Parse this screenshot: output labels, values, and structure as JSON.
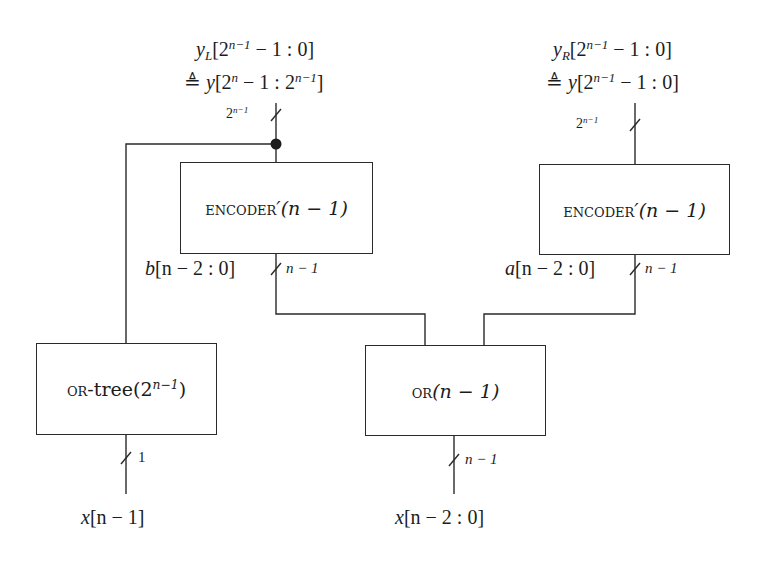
{
  "diagram": {
    "type": "block-diagram",
    "title": "",
    "blocks": [
      {
        "id": "encoder_left",
        "name_sc": "encoder",
        "suffix": "′(n − 1)",
        "label": "ENCODER′(n − 1)"
      },
      {
        "id": "encoder_right",
        "name_sc": "encoder",
        "suffix": "′(n − 1)",
        "label": "ENCODER′(n − 1)"
      },
      {
        "id": "or_tree",
        "name_sc": "or",
        "suffix": "-tree(2",
        "exp": "n−1",
        "close": ")",
        "label": "OR-tree(2^{n−1})"
      },
      {
        "id": "or_n1",
        "name_sc": "or",
        "suffix": "(n − 1)",
        "label": "OR(n − 1)"
      }
    ],
    "top_left_output": {
      "line1": {
        "var": "y",
        "sub": "L",
        "open": "[2",
        "exp": "n−1",
        "rest": " − 1 : 0]"
      },
      "line2": {
        "prefix": "≜ ",
        "var": "y",
        "open": "[2",
        "exp1": "n",
        "mid": " − 1 : 2",
        "exp2": "n−1",
        "close": "]"
      },
      "text": "y_L[2^{n−1} − 1 : 0] ≜ y[2^n − 1 : 2^{n−1}]"
    },
    "top_right_output": {
      "line1": {
        "var": "y",
        "sub": "R",
        "open": "[2",
        "exp": "n−1",
        "rest": " − 1 : 0]"
      },
      "line2": {
        "prefix": "≜ ",
        "var": "y",
        "open": "[2",
        "exp": "n−1",
        "rest": " − 1 : 0]"
      },
      "text": "y_R[2^{n−1} − 1 : 0] ≜ y[2^{n−1} − 1 : 0]"
    },
    "bus_widths": {
      "top_left": {
        "base": "2",
        "exp": "n−1"
      },
      "top_right": {
        "base": "2",
        "exp": "n−1"
      },
      "b_bus": "n − 1",
      "a_bus": "n − 1",
      "or_tree_input": "1",
      "or_input": "n − 1"
    },
    "signal_labels": {
      "b": {
        "var": "b",
        "rest": "[n − 2 : 0]"
      },
      "a": {
        "var": "a",
        "rest": "[n − 2 : 0]"
      },
      "x_msb": {
        "var": "x",
        "rest": "[n − 1]"
      },
      "x_rest": {
        "var": "x",
        "rest": "[n − 2 : 0]"
      }
    },
    "connections": [
      {
        "from": "x[n − 1]",
        "to": "or_tree",
        "width": "1"
      },
      {
        "from": "x[n − 2 : 0]",
        "to": "or_n1",
        "width": "n − 1"
      },
      {
        "from": "or_n1",
        "to": "encoder_left",
        "signal": "b[n − 2 : 0]",
        "width": "n − 1"
      },
      {
        "from": "or_n1",
        "to": "encoder_right",
        "signal": "a[n − 2 : 0]",
        "width": "n − 1"
      },
      {
        "from": "or_tree",
        "to": "junction",
        "note": "joins top-left output bus"
      },
      {
        "from": "encoder_left",
        "to": "y_L",
        "width": "2^{n−1}"
      },
      {
        "from": "encoder_right",
        "to": "y_R",
        "width": "2^{n−1}"
      }
    ],
    "colors": {
      "line": "#2a2a2a",
      "text": "#1c1c1c",
      "background": "#ffffff"
    }
  }
}
